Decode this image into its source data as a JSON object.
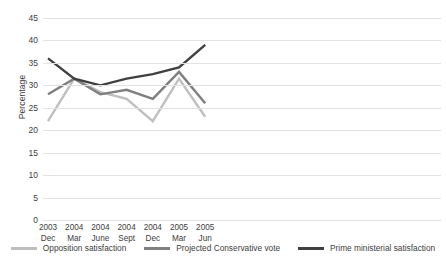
{
  "chart_data": {
    "type": "line",
    "title": "",
    "xlabel": "",
    "ylabel": "Percentage",
    "ylim": [
      0,
      45
    ],
    "ytick_step": 5,
    "yticks": [
      "45",
      "40",
      "35",
      "30",
      "25",
      "20",
      "15",
      "10",
      "5",
      "0"
    ],
    "grid": true,
    "legend_position": "bottom",
    "categories": [
      {
        "year": "2003",
        "month": "Dec"
      },
      {
        "year": "2004",
        "month": "Mar"
      },
      {
        "year": "2004",
        "month": "June"
      },
      {
        "year": "2004",
        "month": "Sept"
      },
      {
        "year": "2004",
        "month": "Dec"
      },
      {
        "year": "2005",
        "month": "Mar"
      },
      {
        "year": "2005",
        "month": "Jun"
      }
    ],
    "series": [
      {
        "name": "Opposition satisfaction",
        "color": "#bfbfbf",
        "values": [
          22,
          31.5,
          28.5,
          27,
          22,
          31.5,
          23
        ]
      },
      {
        "name": "Projected Conservative vote",
        "color": "#7f7f7f",
        "values": [
          28,
          31.5,
          28,
          29,
          27,
          33,
          26
        ]
      },
      {
        "name": "Prime ministerial satisfaction",
        "color": "#404040",
        "values": [
          36,
          31.5,
          30,
          31.5,
          32.5,
          34,
          39
        ]
      }
    ]
  },
  "axis": {
    "y_title": "Percentage"
  }
}
